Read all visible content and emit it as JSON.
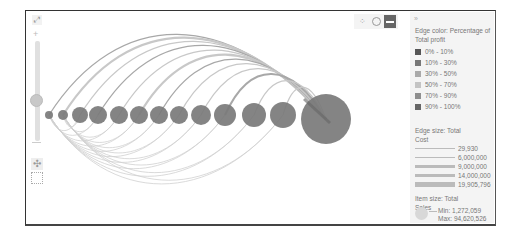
{
  "toolbar": {
    "expand_icon": "⤢",
    "zoom_in": "+",
    "pan_icon": "✣",
    "modes": [
      {
        "name": "scatter-mode",
        "glyph": "⁘"
      },
      {
        "name": "circle-mode",
        "glyph": ""
      },
      {
        "name": "arc-mode",
        "glyph": ""
      }
    ]
  },
  "legend": {
    "collapse_glyph": "»",
    "edge_color_title": "Edge color: Percentage of Total profit",
    "edge_color_items": [
      {
        "label": "0% - 10%",
        "color": "#555555"
      },
      {
        "label": "10% - 30%",
        "color": "#777777"
      },
      {
        "label": "30% - 50%",
        "color": "#aaaaaa"
      },
      {
        "label": "50% - 70%",
        "color": "#c4c4c4"
      },
      {
        "label": "70% - 90%",
        "color": "#8f8f8f"
      },
      {
        "label": "90% - 100%",
        "color": "#666666"
      }
    ],
    "edge_size_title": "Edge size: Total Cost",
    "edge_size_items": [
      {
        "label": "29,930",
        "width": 1
      },
      {
        "label": "6,000,000",
        "width": 1.5
      },
      {
        "label": "9,000,000",
        "width": 2.5
      },
      {
        "label": "14,000,000",
        "width": 3.5
      },
      {
        "label": "19,905,796",
        "width": 4.5
      }
    ],
    "item_size_title": "Item size: Total Sales",
    "item_min": "Min: 1,272,059",
    "item_max": "Max: 94,620,526"
  },
  "chart_data": {
    "type": "arc-diagram",
    "nodes": [
      {
        "x": 23,
        "y": 104,
        "r": 4
      },
      {
        "x": 37,
        "y": 104,
        "r": 5
      },
      {
        "x": 54,
        "y": 104,
        "r": 8
      },
      {
        "x": 72,
        "y": 104,
        "r": 9
      },
      {
        "x": 93,
        "y": 104,
        "r": 9
      },
      {
        "x": 113,
        "y": 104,
        "r": 9
      },
      {
        "x": 133,
        "y": 104,
        "r": 9
      },
      {
        "x": 153,
        "y": 104,
        "r": 9
      },
      {
        "x": 175,
        "y": 104,
        "r": 10
      },
      {
        "x": 199,
        "y": 104,
        "r": 11
      },
      {
        "x": 228,
        "y": 104,
        "r": 12
      },
      {
        "x": 257,
        "y": 104,
        "r": 13
      },
      {
        "x": 300,
        "y": 108,
        "r": 25
      }
    ],
    "node_color": "#7a7a7a",
    "edge_color": "#bdbdbd",
    "edge_size_range": [
      29930,
      19905796
    ],
    "item_size_range": [
      1272059,
      94620526
    ]
  }
}
